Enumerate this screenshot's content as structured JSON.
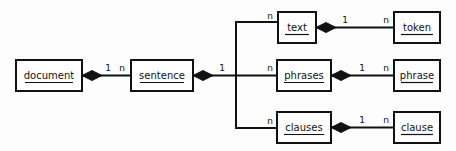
{
  "diagram": {
    "type": "entity-relationship-composition",
    "background_color": "#fdfdfd",
    "line_color": "#111111",
    "box_fill": "#ffffff",
    "entities": [
      {
        "id": "document",
        "label": "document",
        "x": 16,
        "y": 60,
        "width": 66,
        "height": 31
      },
      {
        "id": "sentence",
        "label": "sentence",
        "x": 131,
        "y": 60,
        "width": 62,
        "height": 31
      },
      {
        "id": "text",
        "label": "text",
        "x": 278,
        "y": 12,
        "width": 38,
        "height": 31
      },
      {
        "id": "token",
        "label": "token",
        "x": 394,
        "y": 12,
        "width": 46,
        "height": 31
      },
      {
        "id": "phrases",
        "label": "phrases",
        "x": 277,
        "y": 60,
        "width": 54,
        "height": 31
      },
      {
        "id": "phrase",
        "label": "phrase",
        "x": 394,
        "y": 60,
        "width": 46,
        "height": 31
      },
      {
        "id": "clauses",
        "label": "clauses",
        "x": 277,
        "y": 112,
        "width": 54,
        "height": 31
      },
      {
        "id": "clause",
        "label": "clause",
        "x": 394,
        "y": 112,
        "width": 46,
        "height": 31
      }
    ],
    "relationships": [
      {
        "id": "document-sentence",
        "from": "document",
        "to": "sentence",
        "from_cardinality": "1",
        "to_cardinality": "n",
        "composition_at": "from"
      },
      {
        "id": "sentence-text",
        "from": "sentence",
        "to": "text",
        "from_cardinality": "1",
        "to_cardinality": "n",
        "composition_at": "from"
      },
      {
        "id": "sentence-phrases",
        "from": "sentence",
        "to": "phrases",
        "from_cardinality": "1",
        "to_cardinality": "n",
        "composition_at": "from"
      },
      {
        "id": "sentence-clauses",
        "from": "sentence",
        "to": "clauses",
        "from_cardinality": "1",
        "to_cardinality": "n",
        "composition_at": "from"
      },
      {
        "id": "text-token",
        "from": "text",
        "to": "token",
        "from_cardinality": "1",
        "to_cardinality": "n",
        "composition_at": "from"
      },
      {
        "id": "phrases-phrase",
        "from": "phrases",
        "to": "phrase",
        "from_cardinality": "1",
        "to_cardinality": "n",
        "composition_at": "from"
      },
      {
        "id": "clauses-clause",
        "from": "clauses",
        "to": "clause",
        "from_cardinality": "1",
        "to_cardinality": "n",
        "composition_at": "from"
      }
    ],
    "cardinality_labels": {
      "document_to_sentence_one": "1",
      "document_to_sentence_many": "n",
      "sentence_branch_one": "1",
      "text_many": "n",
      "phrases_many": "n",
      "clauses_many": "n",
      "text_one": "1",
      "token_many": "n",
      "phrases_one": "1",
      "phrase_many": "n",
      "clauses_one": "1",
      "clause_many": "n"
    }
  }
}
